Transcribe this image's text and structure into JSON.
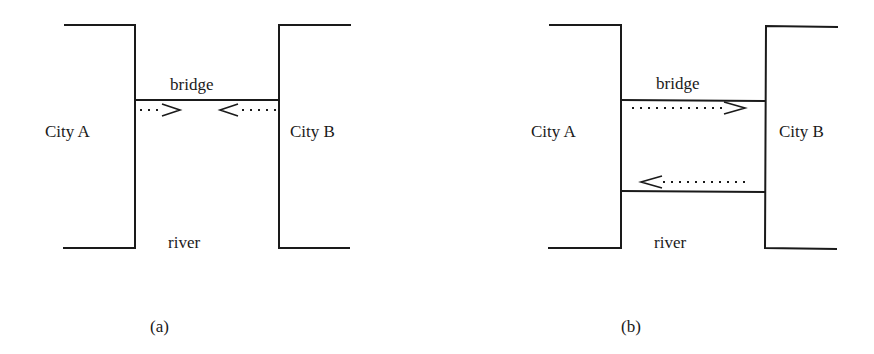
{
  "figure": {
    "panels": [
      {
        "id": "a",
        "caption": "(a)",
        "city_left": "City A",
        "city_right": "City B",
        "bridge_label": "bridge",
        "river_label": "river",
        "bridges": 1,
        "arrows": [
          "A to B (partial, toward middle)",
          "B to A (partial, toward middle)"
        ]
      },
      {
        "id": "b",
        "caption": "(b)",
        "city_left": "City A",
        "city_right": "City B",
        "bridge_label": "bridge",
        "river_label": "river",
        "bridges": 2,
        "arrows": [
          "A to B (upper bridge)",
          "B to A (lower bridge)"
        ]
      }
    ],
    "colors": {
      "ink": "#1a1a1a",
      "background": "#ffffff"
    }
  }
}
